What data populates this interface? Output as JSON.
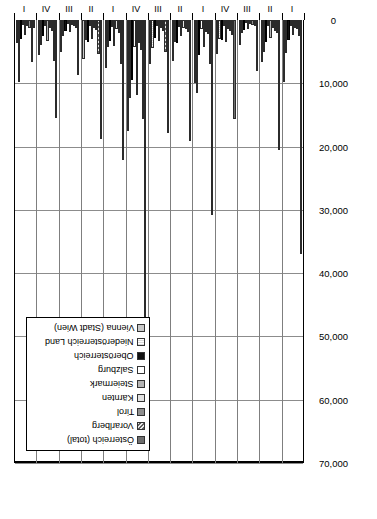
{
  "figure": {
    "caption_fragment": "Fi",
    "rotation": "-90deg"
  },
  "chart_data": {
    "type": "bar",
    "orientation": "horizontal",
    "title": "",
    "xlabel": "",
    "ylabel": "",
    "grid": true,
    "legend_position": "left-inset",
    "xlim": [
      0,
      70000
    ],
    "xticks": [
      0,
      10000,
      20000,
      30000,
      40000,
      50000,
      60000,
      70000
    ],
    "xticklabels": [
      "0",
      "10,000",
      "20,000",
      "30,000",
      "40,000",
      "50,000",
      "60,000",
      "70,000"
    ],
    "categories": [
      "1917 I",
      "1917 II",
      "1917 III",
      "1917 IV",
      "1918 I",
      "1918 II",
      "1918 III",
      "1918 IV",
      "1919 I",
      "1919 II",
      "1919 III",
      "1919 IV",
      "1920 I"
    ],
    "quarter_labels": [
      "I",
      "II",
      "III",
      "IV",
      "I",
      "II",
      "III",
      "IV",
      "I",
      "II",
      "III",
      "IV",
      "I"
    ],
    "year_labels": [
      "1917",
      "1918",
      "1919",
      "1920"
    ],
    "series": [
      {
        "name": "Vienna (Stadt Wien)",
        "values": [
          9800,
          6700,
          3900,
          5400,
          10000,
          6500,
          6900,
          17500,
          7600,
          6100,
          5000,
          5500,
          3700
        ]
      },
      {
        "name": "Niederösterreich Land",
        "values": [
          5200,
          5100,
          2100,
          3000,
          11500,
          3400,
          4400,
          12300,
          4200,
          3200,
          2600,
          4000,
          9800
        ]
      },
      {
        "name": "Oberösterreich",
        "values": [
          3100,
          3400,
          1600,
          3100,
          5600,
          3600,
          2900,
          9500,
          3300,
          3500,
          1700,
          2600,
          3000
        ]
      },
      {
        "name": "Salzburg",
        "values": [
          1000,
          900,
          500,
          1000,
          1400,
          1100,
          900,
          4300,
          1100,
          900,
          600,
          900,
          800
        ]
      },
      {
        "name": "Steiermark",
        "values": [
          2300,
          2900,
          1500,
          3500,
          4300,
          2600,
          3300,
          11900,
          4100,
          3000,
          1900,
          3300,
          2400
        ]
      },
      {
        "name": "Kärnten",
        "values": [
          1200,
          1300,
          700,
          1500,
          1900,
          1200,
          1300,
          3700,
          1500,
          1200,
          800,
          1300,
          1000
        ]
      },
      {
        "name": "Tirol",
        "values": [
          1500,
          1700,
          800,
          1800,
          2200,
          1500,
          1700,
          4800,
          2000,
          1600,
          1000,
          1700,
          1300
        ]
      },
      {
        "name": "Vorarlberg",
        "values": [
          2600,
          2100,
          900,
          2400,
          6900,
          1900,
          5100,
          15600,
          6900,
          5400,
          1200,
          6500,
          6600
        ]
      },
      {
        "name": "Österreich (total)",
        "values": [
          37000,
          20500,
          8000,
          15700,
          30800,
          19200,
          17800,
          64000,
          22200,
          18800,
          8700,
          15500,
          1300
        ]
      }
    ]
  },
  "legend": {
    "items": [
      {
        "label": "Vienna (Stadt Wien)",
        "swatch": "light-grey"
      },
      {
        "label": "Niederösterreich Land",
        "swatch": "fine-dot"
      },
      {
        "label": "Oberösterreich",
        "swatch": "black"
      },
      {
        "label": "Salzburg",
        "swatch": "white"
      },
      {
        "label": "Steiermark",
        "swatch": "mid-grey"
      },
      {
        "label": "Kärnten",
        "swatch": "pale-grey"
      },
      {
        "label": "Tirol",
        "swatch": "dark-grey"
      },
      {
        "label": "Vorarlberg",
        "swatch": "hatch"
      },
      {
        "label": "Österreich (total)",
        "swatch": "charcoal"
      }
    ]
  }
}
